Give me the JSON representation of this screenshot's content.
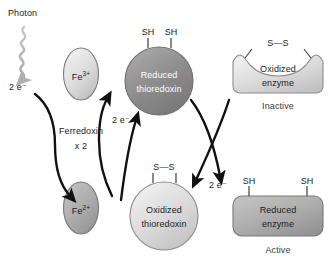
{
  "diagram": {
    "colors": {
      "dark_fill": "#8a8a8a",
      "mid_fill": "#a9a9a9",
      "light_fill": "#d2d2d2",
      "pale_fill": "#e3e3e3",
      "outline": "#6e6e6e",
      "arrow": "#111111",
      "photon": "#b9b9b9",
      "text": "#1c1c1c",
      "text_on_dark": "#ffffff"
    },
    "labels": {
      "photon": "Photon",
      "electrons_photon": "2 e⁻",
      "electrons_ferredoxin": "2 e⁻",
      "electrons_enzyme": "2 e⁻",
      "ferredoxin": "Ferredoxin",
      "ferredoxin_multiplier": "x 2",
      "fe3": "Fe",
      "fe3_charge": "3+",
      "fe2": "Fe",
      "fe2_charge": "2+",
      "reduced_thioredoxin_line1": "Reduced",
      "reduced_thioredoxin_line2": "thioredoxin",
      "oxidized_thioredoxin_line1": "Oxidized",
      "oxidized_thioredoxin_line2": "thioredoxin",
      "thiol_left": "SH",
      "thiol_right": "SH",
      "disulfide_thioredoxin": "S—S",
      "disulfide_enzyme": "S—S",
      "oxidized_enzyme_line1": "Oxidized",
      "oxidized_enzyme_line2": "enzyme",
      "oxidized_enzyme_state": "Inactive",
      "reduced_enzyme_line1": "Reduced",
      "reduced_enzyme_line2": "enzyme",
      "reduced_enzyme_state": "Active",
      "enzyme_thiol_left": "SH",
      "enzyme_thiol_right": "SH"
    }
  }
}
